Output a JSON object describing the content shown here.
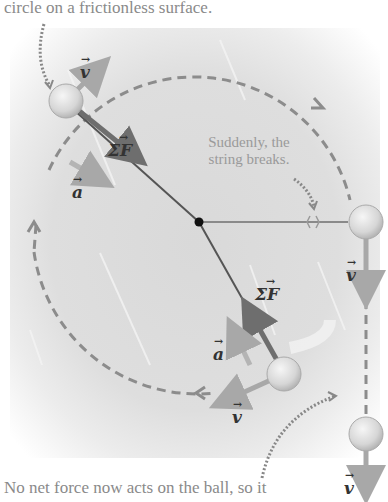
{
  "captions": {
    "top": "circle on a frictionless surface.",
    "bottom": "No net force now acts on the ball, so it",
    "string_break_note": "Suddenly, the string breaks."
  },
  "labels": {
    "velocity": "v",
    "acceleration": "a",
    "net_force": "ΣF",
    "vector_hat": "→"
  },
  "colors": {
    "background": "#dedede",
    "path_dashes": "#8c8c8c",
    "force_arrow": "#6e6e6e",
    "velocity_arrow": "#a8a8a8",
    "ball": "#e4e4e4",
    "caption_text": "#8a8a8a"
  },
  "diagram": {
    "center": {
      "x": 199,
      "y": 222
    },
    "balls": [
      {
        "name": "ball-upper-left",
        "x": 66,
        "y": 101
      },
      {
        "name": "ball-lower",
        "x": 284,
        "y": 374
      },
      {
        "name": "ball-released-1",
        "x": 366,
        "y": 222
      },
      {
        "name": "ball-released-2",
        "x": 366,
        "y": 434
      }
    ]
  }
}
